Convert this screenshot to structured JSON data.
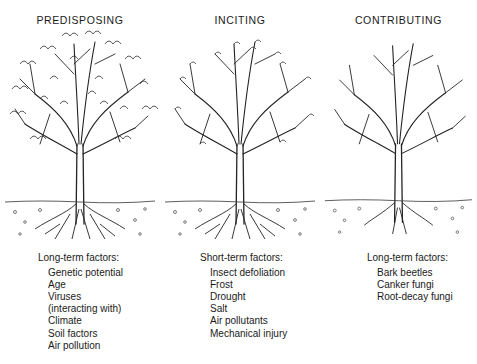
{
  "diagram": {
    "panels": [
      {
        "title": "PREDISPOSING",
        "factor_heading": "Long-term factors:",
        "factors": [
          "Genetic potential",
          "Age",
          "Viruses",
          "(interacting with)",
          "Climate",
          "Soil factors",
          "Air pollution"
        ],
        "tree_state": "full-foliage"
      },
      {
        "title": "INCITING",
        "factor_heading": "Short-term factors:",
        "factors": [
          "Insect defoliation",
          "Frost",
          "Drought",
          "Salt",
          "Air pollutants",
          "Mechanical injury"
        ],
        "tree_state": "sparse-foliage"
      },
      {
        "title": "CONTRIBUTING",
        "factor_heading": "Long-term factors:",
        "factors": [
          "Bark beetles",
          "Canker fungi",
          "Root-decay fungi"
        ],
        "tree_state": "bare-branches"
      }
    ]
  }
}
